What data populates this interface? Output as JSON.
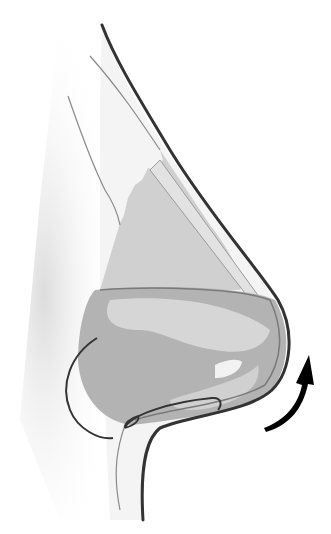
{
  "diagram": {
    "elements": [
      {
        "name": "skin-outline",
        "description": "Outer profile of the nose from dorsum to upper lip"
      },
      {
        "name": "nasal-bone-and-septum",
        "description": "Upper cartilage/bone region with jagged edge"
      },
      {
        "name": "upper-lateral-cartilage",
        "description": "Light band below the dorsum"
      },
      {
        "name": "lower-lateral-cartilage",
        "description": "Darker tip cartilage region"
      },
      {
        "name": "nostril",
        "description": "Light opening near the tip"
      },
      {
        "name": "suture-loops",
        "description": "Dark curved suture lines at the base"
      },
      {
        "name": "rotation-arrow",
        "description": "Black curved arrow pointing upward beside the tip"
      }
    ],
    "colors": {
      "outline": "#3a3a3a",
      "shadow": "#e6e6e6",
      "cartilage_light": "#d6d6d6",
      "cartilage_mid": "#bdbdbd",
      "cartilage_dark": "#a8a8a8",
      "arrow": "#000000"
    }
  }
}
